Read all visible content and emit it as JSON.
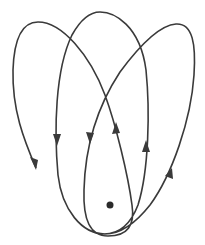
{
  "diagram": {
    "type": "precessing-orbit",
    "colors": {
      "stroke": "#3a3a3a",
      "background": "#ffffff",
      "focus": "#2a2a2a"
    },
    "focus_dot": {
      "x": 110,
      "y": 205,
      "r": 3.5
    },
    "loops": 3,
    "arrow_count": 6
  }
}
